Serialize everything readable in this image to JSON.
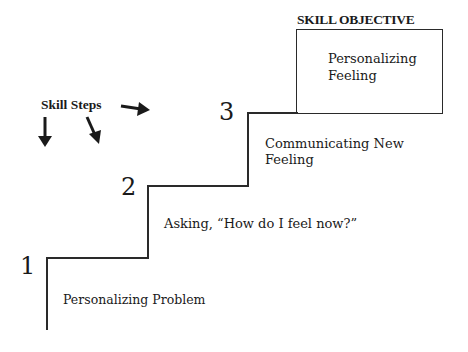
{
  "objective": {
    "title": "SKILL OBJECTIVE",
    "text_line1": "Personalizing",
    "text_line2": "Feeling"
  },
  "skill_steps_label": "Skill Steps",
  "steps": [
    {
      "number": "1",
      "label": "Personalizing Problem"
    },
    {
      "number": "2",
      "label": "Asking, “How do I feel now?”"
    },
    {
      "number": "3",
      "label_line1": "Communicating New",
      "label_line2": "Feeling"
    }
  ]
}
